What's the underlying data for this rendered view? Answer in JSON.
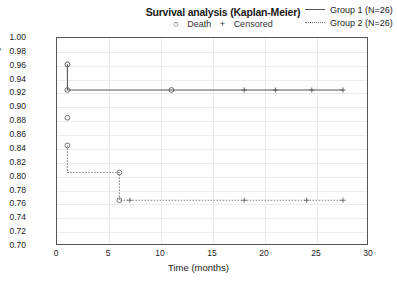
{
  "header": {
    "title": "Survival analysis (Kaplan-Meier)",
    "death_symbol": "○",
    "death_label": "Death",
    "censored_symbol": "+",
    "censored_label": "Censored"
  },
  "legend": {
    "position": "top-right",
    "entries": [
      {
        "label": "Group 1 (N=26)",
        "style": "solid",
        "color": "#555555"
      },
      {
        "label": "Group 2 (N=26)",
        "style": "dotted",
        "color": "#666666"
      }
    ]
  },
  "chart_data": {
    "type": "line",
    "title": "Survival analysis (Kaplan-Meier)",
    "xlabel": "Time (months)",
    "ylabel": "Probability of survival",
    "xlim": [
      0,
      30
    ],
    "ylim": [
      0.7,
      1.0
    ],
    "xticks": [
      0,
      5,
      10,
      15,
      20,
      25,
      30
    ],
    "yticks": [
      "1.00",
      "0.98",
      "0.96",
      "0.94",
      "0.92",
      "0.90",
      "0.88",
      "0.86",
      "0.84",
      "0.82",
      "0.80",
      "0.78",
      "0.76",
      "0.74",
      "0.72",
      "0.70"
    ],
    "grid": true,
    "series": [
      {
        "name": "Group 1 (N=26)",
        "style": "solid",
        "color": "#555555",
        "steps": [
          {
            "x": 1,
            "y": 0.962
          },
          {
            "x": 11,
            "y": 0.925
          },
          {
            "x": 27.5,
            "y": 0.925
          }
        ],
        "death_markers": [
          {
            "x": 1,
            "y": 0.962
          },
          {
            "x": 11,
            "y": 0.925
          }
        ],
        "censored_markers": [
          {
            "x": 18,
            "y": 0.925
          },
          {
            "x": 21,
            "y": 0.925
          },
          {
            "x": 24.5,
            "y": 0.925
          },
          {
            "x": 27.5,
            "y": 0.925
          }
        ]
      },
      {
        "name": "Group 2 (N=26)",
        "style": "dotted",
        "color": "#666666",
        "steps": [
          {
            "x": 1,
            "y": 0.845
          },
          {
            "x": 6,
            "y": 0.806
          },
          {
            "x": 6,
            "y": 0.766
          },
          {
            "x": 27.5,
            "y": 0.766
          }
        ],
        "death_markers": [
          {
            "x": 1,
            "y": 0.925
          },
          {
            "x": 1,
            "y": 0.885
          },
          {
            "x": 1,
            "y": 0.845
          },
          {
            "x": 6,
            "y": 0.806
          },
          {
            "x": 6,
            "y": 0.766
          }
        ],
        "censored_markers": [
          {
            "x": 7,
            "y": 0.766
          },
          {
            "x": 18,
            "y": 0.766
          },
          {
            "x": 24,
            "y": 0.766
          },
          {
            "x": 27.5,
            "y": 0.766
          }
        ]
      }
    ]
  }
}
